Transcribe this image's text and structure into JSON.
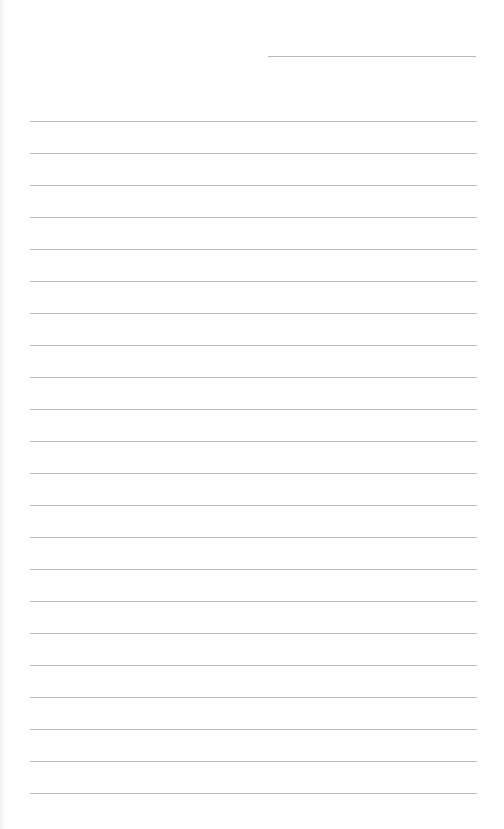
{
  "page": {
    "type": "lined-paper",
    "background_color": "#ffffff",
    "rule_color": "#bdbdbd",
    "header_line": {
      "left": 268,
      "top": 56,
      "width": 208
    },
    "rules": {
      "count": 22,
      "first_top": 121,
      "spacing": 32,
      "left": 30,
      "width": 447
    }
  }
}
